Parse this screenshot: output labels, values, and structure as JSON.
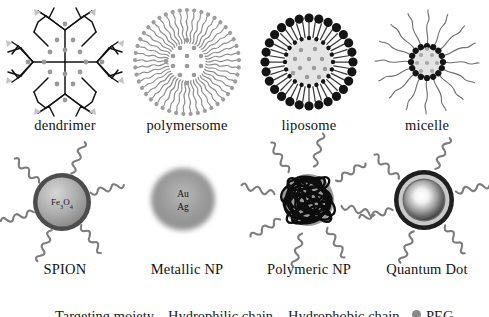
{
  "figure": {
    "type": "scientific-illustration-panel",
    "background_color": "#ffffff",
    "rows": 2,
    "columns": 4
  },
  "palette": {
    "ink": "#131313",
    "black": "#1a1a1a",
    "dark_gray": "#555555",
    "mid_gray": "#8c8c8c",
    "light_gray": "#bdbdbd",
    "pale_gray": "#e2e2e2",
    "core_fill": "#d9d9d9",
    "white": "#ffffff"
  },
  "row1": {
    "items": [
      {
        "id": "dendrimer",
        "label": "dendrimer",
        "icon": "dendrimer-icon",
        "structure": "four-armed symmetric branching tree with bifurcating generations",
        "core": "central cross junction",
        "branches": 4,
        "generations": 3,
        "cargo_dots": 16,
        "cargo_color": "#9a9a9a",
        "terminal_ligands": "pale gray arrowhead groups at branch tips",
        "stroke_color": "#131313"
      },
      {
        "id": "polymersome",
        "label": "polymersome",
        "icon": "polymersome-icon",
        "structure": "thick bilayer corona of amphiphilic block-copolymer chains",
        "chain_count": 46,
        "chain_color": "#909090",
        "head_group_color": "#9e9e9e",
        "lumen": "hollow aqueous core",
        "cargo_dots": 13,
        "cargo_color": "#9a9a9a"
      },
      {
        "id": "liposome",
        "label": "liposome",
        "icon": "liposome-icon",
        "structure": "phospholipid bilayer vesicle",
        "outer_head_groups": 28,
        "inner_head_groups": 20,
        "head_group_color": "#141414",
        "tail_color": "#3a3a3a",
        "lumen_fill": "#e4e4e4",
        "cargo_dots": 11,
        "cargo_color": "#9a9a9a"
      },
      {
        "id": "micelle",
        "label": "micelle",
        "icon": "micelle-icon",
        "structure": "single-layer surfactant monolayer with hydrophobic core",
        "head_groups": 16,
        "head_group_color": "#141414",
        "tail_count": 16,
        "tail_color": "#6e6e6e",
        "core_fill": "#e4e4e4",
        "cargo_dots": 8,
        "cargo_color": "#a8a8a8"
      }
    ]
  },
  "row2": {
    "items": [
      {
        "id": "spion",
        "label": "SPION",
        "icon": "spion-icon",
        "structure": "superparamagnetic iron-oxide core with dense shell and PEG coils",
        "core_label": "Fe3O4",
        "core_label_parts": {
          "base1": "Fe",
          "sub1": "3",
          "base2": "O",
          "sub2": "4"
        },
        "shell_color": "#4d4d4d",
        "core_gradient": [
          "#cfcfcf",
          "#8f8f8f"
        ],
        "coil_count": 6,
        "coil_color": "#7d7d7d"
      },
      {
        "id": "metallic-np",
        "label": "Metallic NP",
        "icon": "metallic-np-icon",
        "structure": "soft-edged solid metal nanosphere with diffuse halo",
        "core_label_line1": "Au",
        "core_label_line2": "Ag",
        "core_gradient": [
          "#7f7f7f",
          "#bfbfbf"
        ],
        "halo": "blurred gray glow",
        "coil_count": 0
      },
      {
        "id": "polymeric-np",
        "label": "Polymeric NP",
        "icon": "polymeric-np-icon",
        "structure": "entangled random-coil polymer mass with grafted PEG springs",
        "scribble_color": "#0d0d0d",
        "scribble_loops": 26,
        "coil_count": 8,
        "coil_color": "#7d7d7d"
      },
      {
        "id": "quantum-dot",
        "label": "Quantum Dot",
        "icon": "quantum-dot-icon",
        "structure": "core-shell semiconductor crystal, luminescent white center",
        "shell_layers": [
          "#1f1f1f",
          "#c9c9c9",
          "#6b6b6b"
        ],
        "core_gradient": [
          "#ffffff",
          "#4a4a4a"
        ],
        "coil_count": 6,
        "coil_color": "#7d7d7d"
      }
    ]
  },
  "legend_cropped": {
    "visible": "top sliver of glyph tops only — text clipped by image boundary",
    "items": [
      {
        "text": "Targeting moiety"
      },
      {
        "text": "Hydrophilic chain"
      },
      {
        "text": "Hydrophobic chain"
      },
      {
        "text": "PEG"
      }
    ]
  }
}
